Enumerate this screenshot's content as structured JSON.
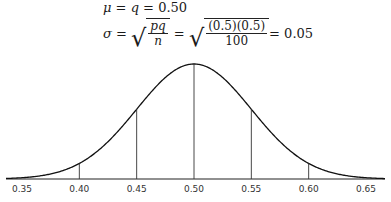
{
  "formulas": {
    "line1": {
      "lhs": "μ = q = ",
      "value": "0.50",
      "mu": "μ",
      "q": "q"
    },
    "line2": {
      "lhs": "σ = ",
      "frac_num": "pq",
      "frac_den": "n",
      "eq1": " = ",
      "num_value": "(0.5)(0.5)",
      "den_value": "100",
      "eq2": " = 0.05"
    }
  },
  "chart_data": {
    "type": "line",
    "xlabel": "",
    "ylabel": "",
    "mean": 0.5,
    "std": 0.05,
    "x_ticks": [
      "0.35",
      "0.40",
      "0.45",
      "0.50",
      "0.55",
      "0.60",
      "0.65"
    ],
    "x_range": [
      0.35,
      0.65
    ],
    "vertical_lines_at": [
      0.4,
      0.45,
      0.5,
      0.55,
      0.6
    ],
    "grid": false,
    "legend": null
  }
}
